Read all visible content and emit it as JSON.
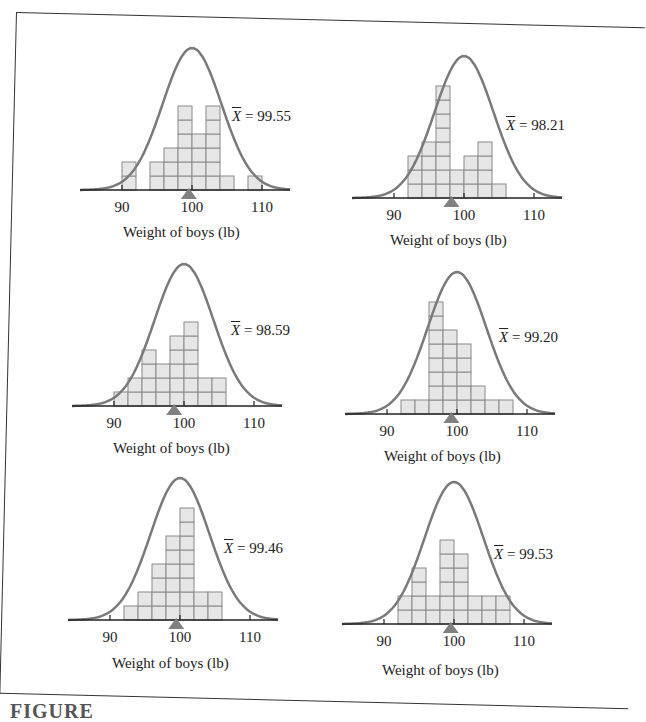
{
  "colors": {
    "curve": "#7a7a7a",
    "bar_fill": "#e6e6e6",
    "bar_stroke": "#8a8a8a",
    "axis": "#222222",
    "marker": "#808080"
  },
  "caption": "FIGURE",
  "panels": [
    {
      "mean_label": "X̄ = 99.55",
      "mean_symbol": "X",
      "mean_value": "= 99.55",
      "xlabel": "Weight of boys (lb)",
      "ticks": [
        "90",
        "100",
        "110"
      ]
    },
    {
      "mean_label": "X̄ = 98.21",
      "mean_symbol": "X",
      "mean_value": "= 98.21",
      "xlabel": "Weight of boys (lb)",
      "ticks": [
        "90",
        "100",
        "110"
      ]
    },
    {
      "mean_label": "X̄ = 98.59",
      "mean_symbol": "X",
      "mean_value": "= 98.59",
      "xlabel": "Weight of boys (lb)",
      "ticks": [
        "90",
        "100",
        "110"
      ]
    },
    {
      "mean_label": "X̄ = 99.20",
      "mean_symbol": "X",
      "mean_value": "= 99.20",
      "xlabel": "Weight of boys (lb)",
      "ticks": [
        "90",
        "100",
        "110"
      ]
    },
    {
      "mean_label": "X̄ = 99.46",
      "mean_symbol": "X",
      "mean_value": "= 99.46",
      "xlabel": "Weight of boys (lb)",
      "ticks": [
        "90",
        "100",
        "110"
      ]
    },
    {
      "mean_label": "X̄ = 99.53",
      "mean_symbol": "X",
      "mean_value": "= 99.53",
      "xlabel": "Weight of boys (lb)",
      "ticks": [
        "90",
        "100",
        "110"
      ]
    }
  ],
  "chart_data": [
    {
      "type": "bar",
      "title": "Sample 1",
      "xlabel": "Weight of boys (lb)",
      "ylabel": "",
      "xlim": [
        84,
        114
      ],
      "x_ticks": [
        90,
        100,
        110
      ],
      "bin_width": 2,
      "bins": [
        90,
        92,
        94,
        96,
        98,
        100,
        102,
        104,
        106,
        108
      ],
      "values": [
        2,
        0,
        2,
        3,
        6,
        4,
        6,
        1,
        0,
        1
      ],
      "mean": 99.55,
      "overlay": "normal curve centered at 100"
    },
    {
      "type": "bar",
      "title": "Sample 2",
      "xlabel": "Weight of boys (lb)",
      "ylabel": "",
      "xlim": [
        84,
        114
      ],
      "x_ticks": [
        90,
        100,
        110
      ],
      "bin_width": 2,
      "bins": [
        92,
        94,
        96,
        98,
        100,
        102,
        104
      ],
      "values": [
        3,
        4,
        8,
        2,
        3,
        4,
        1
      ],
      "mean": 98.21,
      "overlay": "normal curve centered at 100"
    },
    {
      "type": "bar",
      "title": "Sample 3",
      "xlabel": "Weight of boys (lb)",
      "ylabel": "",
      "xlim": [
        84,
        114
      ],
      "x_ticks": [
        90,
        100,
        110
      ],
      "bin_width": 2,
      "bins": [
        90,
        92,
        94,
        96,
        98,
        100,
        102,
        104
      ],
      "values": [
        1,
        2,
        4,
        3,
        5,
        6,
        2,
        2
      ],
      "mean": 98.59,
      "overlay": "normal curve centered at 100"
    },
    {
      "type": "bar",
      "title": "Sample 4",
      "xlabel": "Weight of boys (lb)",
      "ylabel": "",
      "xlim": [
        84,
        114
      ],
      "x_ticks": [
        90,
        100,
        110
      ],
      "bin_width": 2,
      "bins": [
        92,
        94,
        96,
        98,
        100,
        102,
        104,
        106
      ],
      "values": [
        1,
        1,
        8,
        6,
        5,
        2,
        1,
        1
      ],
      "mean": 99.2,
      "overlay": "normal curve centered at 100"
    },
    {
      "type": "bar",
      "title": "Sample 5",
      "xlabel": "Weight of boys (lb)",
      "ylabel": "",
      "xlim": [
        84,
        114
      ],
      "x_ticks": [
        90,
        100,
        110
      ],
      "bin_width": 2,
      "bins": [
        92,
        94,
        96,
        98,
        100,
        102,
        104
      ],
      "values": [
        1,
        2,
        4,
        6,
        8,
        2,
        2
      ],
      "mean": 99.46,
      "overlay": "normal curve centered at 100"
    },
    {
      "type": "bar",
      "title": "Sample 6",
      "xlabel": "Weight of boys (lb)",
      "ylabel": "",
      "xlim": [
        84,
        114
      ],
      "x_ticks": [
        90,
        100,
        110
      ],
      "bin_width": 2,
      "bins": [
        92,
        94,
        96,
        98,
        100,
        102,
        104,
        106
      ],
      "values": [
        2,
        4,
        2,
        6,
        5,
        2,
        2,
        2
      ],
      "mean": 99.53,
      "overlay": "normal curve centered at 100"
    }
  ]
}
